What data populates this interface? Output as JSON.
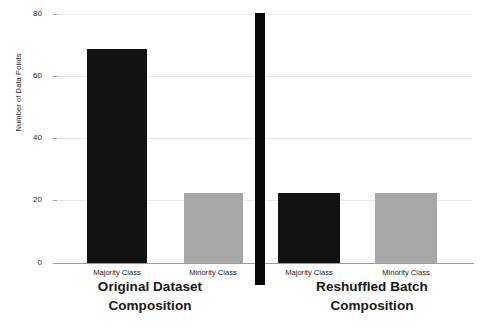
{
  "figure": {
    "background": "#ffffff",
    "width": 481,
    "height": 327
  },
  "axis": {
    "ylabel": "Number of Data Points",
    "yticks": [
      "0",
      "20",
      "40",
      "60",
      "80"
    ],
    "ylim": [
      0,
      80
    ]
  },
  "panels": {
    "left": {
      "title_line1": "Original Dataset",
      "title_line2": "Composition",
      "clipped_suptitle": "",
      "categories": [
        "Majority Class",
        "Minority Class"
      ]
    },
    "right": {
      "title_line1": "Reshuffled Batch",
      "title_line2": "Composition",
      "clipped_suptitle": "",
      "categories": [
        "Majority Class",
        "Minority Class"
      ]
    }
  },
  "colors": {
    "majority_bar": "#121212",
    "minority_bar": "#a6a6a6",
    "gridline": "#e9e9ea",
    "axis": "#9a9a9a",
    "divider": "#080808",
    "text": "#1b1b1b"
  },
  "chart_data": [
    {
      "type": "bar",
      "title": "Original Dataset Composition",
      "categories": [
        "Majority Class",
        "Minority Class"
      ],
      "values": [
        73,
        24
      ],
      "xlabel": "",
      "ylabel": "Number of Data Points",
      "ylim": [
        0,
        80
      ],
      "yticks": [
        0,
        20,
        40,
        60,
        80
      ],
      "grid": true,
      "legend": "none",
      "bar_colors": [
        "#121212",
        "#a6a6a6"
      ]
    },
    {
      "type": "bar",
      "title": "Reshuffled Batch Composition",
      "categories": [
        "Majority Class",
        "Minority Class"
      ],
      "values": [
        24,
        24
      ],
      "xlabel": "",
      "ylabel": "Number of Data Points",
      "ylim": [
        0,
        80
      ],
      "yticks": [
        0,
        20,
        40,
        60,
        80
      ],
      "grid": true,
      "legend": "none",
      "bar_colors": [
        "#121212",
        "#a6a6a6"
      ]
    }
  ]
}
